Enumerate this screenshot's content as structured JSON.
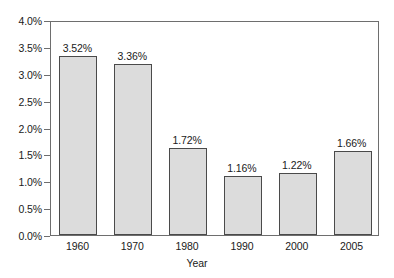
{
  "chart_data": {
    "type": "bar",
    "title": "",
    "subtitle": "",
    "xlabel": "Year",
    "ylabel": "",
    "categories": [
      "1960",
      "1970",
      "1980",
      "1990",
      "2000",
      "2005"
    ],
    "values": [
      3.52,
      3.36,
      1.72,
      1.16,
      1.22,
      1.66
    ],
    "value_labels": [
      "3.52%",
      "3.36%",
      "1.72%",
      "1.16%",
      "1.22%",
      "1.66%"
    ],
    "ylim": [
      0.0,
      4.0
    ],
    "ytick_values": [
      0.0,
      0.5,
      1.0,
      1.5,
      2.0,
      2.5,
      3.0,
      3.5,
      4.0
    ],
    "ytick_labels": [
      "0.0%",
      "0.5%",
      "1.0%",
      "1.5%",
      "2.0%",
      "2.5%",
      "3.0%",
      "3.5%",
      "4.0%"
    ],
    "grid": false,
    "legend": false,
    "legend_position": "none",
    "bar_fill_color": "#dcdcdc",
    "bar_border_color": "#4a4a4a",
    "axis_color": "#6e6e6e",
    "background_color": "#ffffff",
    "text_color": "#1a1a1a",
    "annotations": []
  }
}
